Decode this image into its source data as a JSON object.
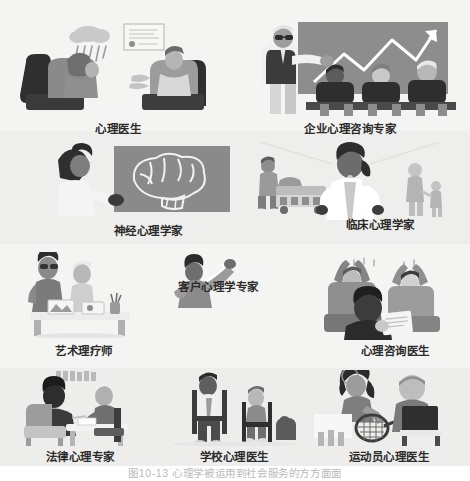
{
  "figure": {
    "caption": "图10-13  心理学被运用到社会服务的方方面面",
    "background": "#f2f2f1",
    "label_color": "#2b2b2b"
  },
  "panels": [
    {
      "id": "psychologist",
      "label": "心理医生",
      "scene": "therapy-session-rain-cloud",
      "row": 1
    },
    {
      "id": "corporate-consultant",
      "label": "企业心理咨询专家",
      "scene": "presenter-growth-chart-audience",
      "row": 1
    },
    {
      "id": "neuropsychologist",
      "label": "神经心理学家",
      "scene": "doctor-pointing-brain-diagram",
      "row": 2
    },
    {
      "id": "clinical-psychologist",
      "label": "临床心理学家",
      "scene": "white-coat-doctor-patients",
      "row": 2
    },
    {
      "id": "art-therapist",
      "label": "艺术理疗师",
      "scene": "art-therapy-painting-easel",
      "row": 3
    },
    {
      "id": "customer-psychologist",
      "label": "客户心理学专家",
      "scene": "person-pointing-upward",
      "row": 3
    },
    {
      "id": "counseling-doctor",
      "label": "心理咨询医生",
      "scene": "counselor-with-happy-clients",
      "row": 3
    },
    {
      "id": "legal-psychologist",
      "label": "法律心理专家",
      "scene": "interview-at-table-bookshelf",
      "row": 4
    },
    {
      "id": "school-psychologist",
      "label": "学校心理医生",
      "scene": "teacher-and-student-on-chairs",
      "row": 4
    },
    {
      "id": "sports-psychologist",
      "label": "运动员心理医生",
      "scene": "tennis-player-and-athlete",
      "row": 4
    }
  ],
  "colors": {
    "dark": "#3c3c3c",
    "mid": "#7d7d7d",
    "light": "#c9c9c9",
    "accent": "#9b9b9b",
    "white": "#ffffff",
    "band_light": "#f4f4f3",
    "band_dark": "#eeeeec"
  }
}
